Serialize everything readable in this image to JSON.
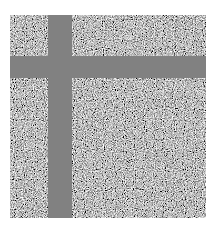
{
  "image": {
    "type": "noise-texture",
    "caption": "",
    "colors": {
      "background": "#ffffff",
      "band": "#818181",
      "noise_mid": "#7a7a7a"
    },
    "regions": {
      "noise_field": {
        "x": 10,
        "y": 15,
        "width": 196,
        "height": 203
      },
      "vertical_band": {
        "x": 48,
        "width": 24
      },
      "horizontal_band": {
        "y": 56,
        "height": 22
      }
    }
  }
}
